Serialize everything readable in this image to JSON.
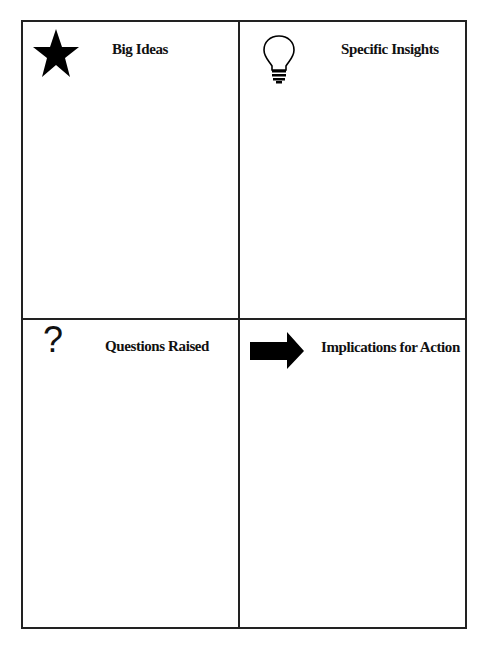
{
  "quadrants": [
    {
      "id": "top-left",
      "label": "Big Ideas",
      "icon": "star-icon"
    },
    {
      "id": "top-right",
      "label": "Specific Insights",
      "icon": "lightbulb-icon"
    },
    {
      "id": "bottom-left",
      "label": "Questions Raised",
      "icon": "question-mark-icon",
      "glyph": "?"
    },
    {
      "id": "bottom-right",
      "label": "Implications for Action",
      "icon": "arrow-right-icon"
    }
  ]
}
